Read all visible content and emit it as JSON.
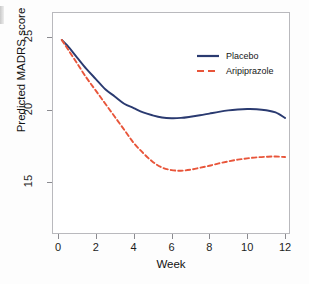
{
  "chart_data": {
    "type": "line",
    "title": "",
    "xlabel": "Week",
    "ylabel": "Predicted MADRS score",
    "xlim": [
      0,
      12
    ],
    "ylim": [
      12.5,
      26.5
    ],
    "xticks": [
      "0",
      "2",
      "4",
      "6",
      "8",
      "10",
      "12"
    ],
    "yticks": [
      "25",
      "20",
      "15"
    ],
    "grid": false,
    "legend_position": "top-right",
    "series": [
      {
        "name": "Placebo",
        "color": "#2a3a70",
        "style": "solid",
        "x": [
          0.2,
          0.5,
          1.0,
          1.5,
          2.0,
          2.5,
          3.0,
          3.5,
          4.0,
          4.5,
          5.0,
          5.5,
          6.0,
          6.5,
          7.0,
          7.5,
          8.0,
          8.5,
          9.0,
          9.5,
          10.0,
          10.5,
          11.0,
          11.5,
          12.0
        ],
        "y": [
          24.8,
          24.4,
          23.6,
          22.8,
          22.1,
          21.4,
          20.9,
          20.4,
          20.1,
          19.8,
          19.6,
          19.45,
          19.4,
          19.42,
          19.5,
          19.6,
          19.72,
          19.84,
          19.94,
          20.0,
          20.03,
          20.02,
          19.95,
          19.8,
          19.42
        ]
      },
      {
        "name": "Aripiprazole",
        "color": "#e8553a",
        "style": "dashed",
        "x": [
          0.2,
          0.5,
          1.0,
          1.5,
          2.0,
          2.5,
          3.0,
          3.5,
          4.0,
          4.5,
          5.0,
          5.5,
          6.0,
          6.5,
          7.0,
          7.5,
          8.0,
          8.5,
          9.0,
          9.5,
          10.0,
          10.5,
          11.0,
          11.5,
          12.0
        ],
        "y": [
          24.8,
          24.2,
          23.2,
          22.2,
          21.3,
          20.4,
          19.5,
          18.6,
          17.7,
          17.0,
          16.4,
          16.0,
          15.82,
          15.78,
          15.85,
          15.98,
          16.12,
          16.28,
          16.42,
          16.54,
          16.63,
          16.7,
          16.74,
          16.76,
          16.72
        ]
      }
    ]
  },
  "legend": {
    "items": [
      {
        "label": "Placebo",
        "color": "#2a3a70",
        "style": "solid"
      },
      {
        "label": "Aripiprazole",
        "color": "#e8553a",
        "style": "dashed"
      }
    ]
  }
}
